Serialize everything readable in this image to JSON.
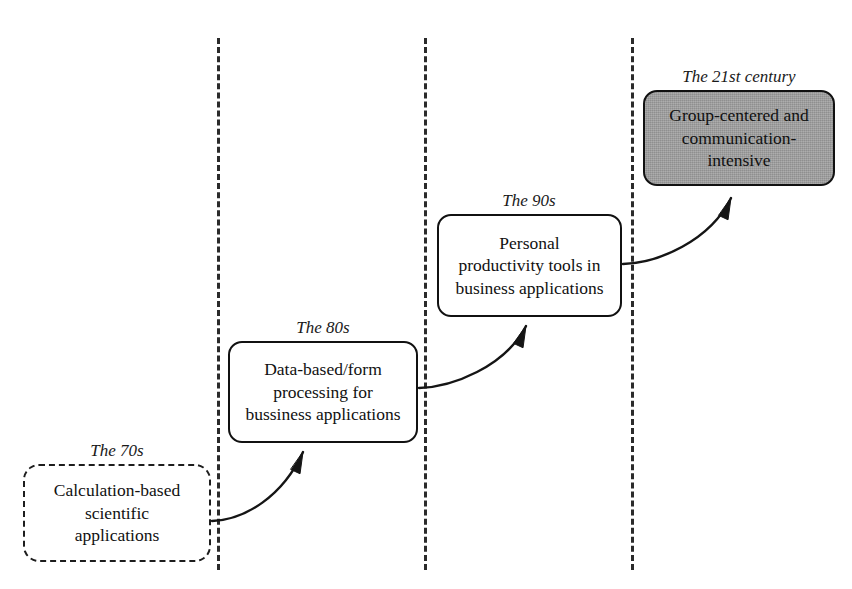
{
  "diagram": {
    "canvas": {
      "width": 852,
      "height": 589,
      "background": "#ffffff"
    },
    "colors": {
      "line": "#2b2b2b",
      "box_border": "#111111",
      "box_fill_default": "#ffffff",
      "box_fill_highlight": "#9b9b9b",
      "text": "#111111"
    },
    "dividers": [
      {
        "name": "divider-1",
        "x": 217,
        "y_top": 38,
        "y_bottom": 570
      },
      {
        "name": "divider-2",
        "x": 424,
        "y_top": 38,
        "y_bottom": 570
      },
      {
        "name": "divider-3",
        "x": 631,
        "y_top": 38,
        "y_bottom": 570
      }
    ],
    "stages": [
      {
        "id": "stage-70s",
        "era_label": "The 70s",
        "body": "Calculation-based scientific applications",
        "lines": [
          "Calculation-based",
          "scientific",
          "applications"
        ],
        "style": "dashed",
        "highlighted": false,
        "x": 23,
        "y": 464,
        "width": 188,
        "height": 98,
        "label_x": 117,
        "label_y": 442
      },
      {
        "id": "stage-80s",
        "era_label": "The 80s",
        "body": "Data-based/form processing for bussiness applications",
        "lines": [
          "Data-based/form",
          "processing for",
          "bussiness applications"
        ],
        "style": "solid",
        "highlighted": false,
        "x": 228,
        "y": 341,
        "width": 190,
        "height": 102,
        "label_x": 323,
        "label_y": 319
      },
      {
        "id": "stage-90s",
        "era_label": "The 90s",
        "body": "Personal productivity tools in business applications",
        "lines": [
          "Personal",
          "productivity tools in",
          "business applications"
        ],
        "style": "solid",
        "highlighted": false,
        "x": 437,
        "y": 214,
        "width": 185,
        "height": 103,
        "label_x": 529,
        "label_y": 192
      },
      {
        "id": "stage-21st-century",
        "era_label": "The 21st century",
        "body": "Group-centered and communication-intensive",
        "lines": [
          "Group-centered and",
          "communication-",
          "intensive"
        ],
        "style": "filled",
        "highlighted": true,
        "x": 643,
        "y": 90,
        "width": 192,
        "height": 96,
        "label_x": 739,
        "label_y": 68
      }
    ],
    "arrows": [
      {
        "name": "arrow-70s-to-80s",
        "from": "stage-70s",
        "to": "stage-80s",
        "path": "M 212 521 C 245 520, 283 496, 303 452",
        "tip": [
          303,
          452
        ]
      },
      {
        "name": "arrow-80s-to-90s",
        "from": "stage-80s",
        "to": "stage-90s",
        "path": "M 419 388 C 452 387, 505 367, 526 326",
        "tip": [
          526,
          326
        ]
      },
      {
        "name": "arrow-90s-to-21st",
        "from": "stage-90s",
        "to": "stage-21st-century",
        "path": "M 623 264 C 658 263, 710 241, 731 198",
        "tip": [
          731,
          198
        ]
      }
    ]
  }
}
